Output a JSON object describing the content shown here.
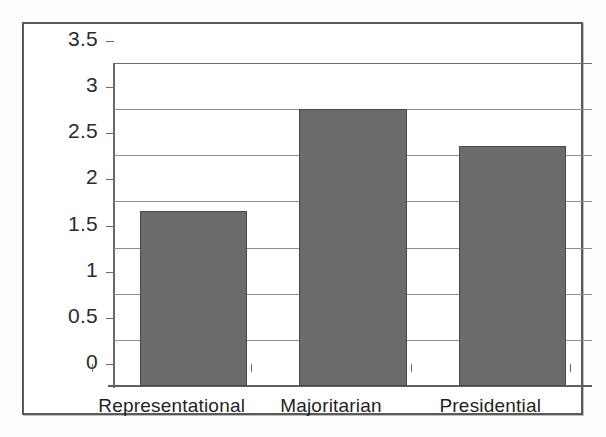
{
  "chart_data": {
    "type": "bar",
    "title": "",
    "subtitle": "",
    "xlabel": "",
    "ylabel": "",
    "categories": [
      "Representational",
      "Majoritarian",
      "Presidential"
    ],
    "values": [
      1.9,
      3.0,
      2.6
    ],
    "series": [
      {
        "name": "",
        "values": [
          1.9,
          3.0,
          2.6
        ]
      }
    ],
    "ylim": [
      0,
      3.5
    ],
    "yticks": [
      0,
      0.5,
      1,
      1.5,
      2,
      2.5,
      3,
      3.5
    ],
    "ytick_labels": [
      "0",
      "0.5",
      "1",
      "1.5",
      "2",
      "2.5",
      "3",
      "3.5"
    ],
    "grid": true,
    "grid_axis": "y",
    "legend": false,
    "legend_position": "none",
    "bar_color": "#6b6b6b",
    "bar_edge_color": "#4a4a4a",
    "grid_color": "#8e8e8e",
    "axis_color": "#6a6a6a",
    "frame_color": "#5a5a5a",
    "background_color": "#ffffff",
    "annotations": []
  }
}
